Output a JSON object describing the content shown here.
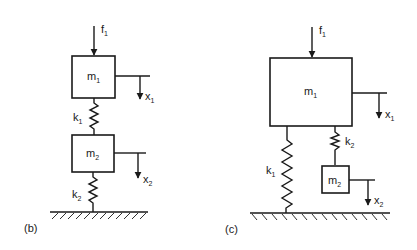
{
  "diagrams": [
    {
      "caption": "(b)",
      "force": {
        "label": "f",
        "sub": "1"
      },
      "masses": [
        {
          "label": "m",
          "sub": "1"
        },
        {
          "label": "m",
          "sub": "2"
        }
      ],
      "springs": [
        {
          "label": "k",
          "sub": "1"
        },
        {
          "label": "k",
          "sub": "2"
        }
      ],
      "displacements": [
        {
          "label": "x",
          "sub": "1"
        },
        {
          "label": "x",
          "sub": "2"
        }
      ]
    },
    {
      "caption": "(c)",
      "force": {
        "label": "f",
        "sub": "1"
      },
      "masses": [
        {
          "label": "m",
          "sub": "1"
        },
        {
          "label": "m",
          "sub": "2"
        }
      ],
      "springs": [
        {
          "label": "k",
          "sub": "1"
        },
        {
          "label": "k",
          "sub": "2"
        }
      ],
      "displacements": [
        {
          "label": "x",
          "sub": "1"
        },
        {
          "label": "x",
          "sub": "2"
        }
      ]
    }
  ]
}
